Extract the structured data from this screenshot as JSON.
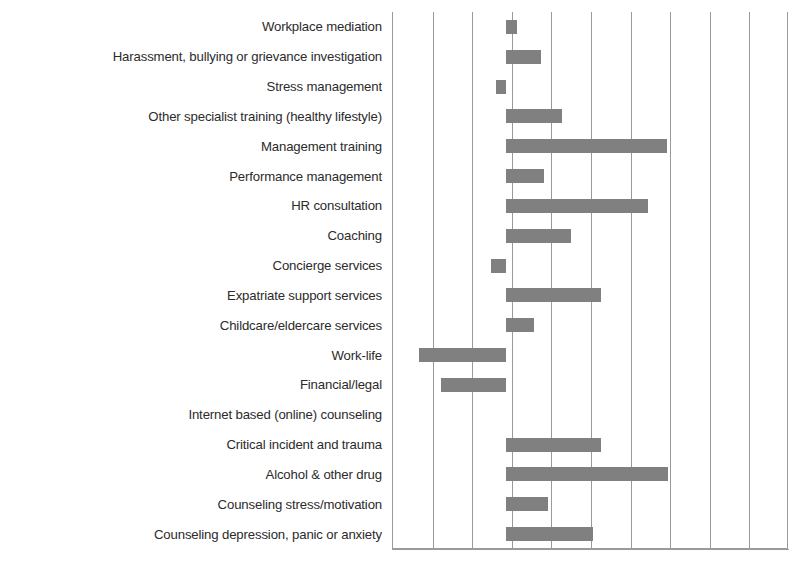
{
  "chart_data": {
    "type": "bar",
    "orientation": "horizontal",
    "title": "",
    "subtitle": "",
    "xlabel": "",
    "ylabel": "",
    "grid": true,
    "legend": false,
    "legend_position": "none",
    "bar_color": "#808080",
    "axis_color": "#9a9a9a",
    "gridline_color": "#9a9a9a",
    "label_color": "#2b2b2b",
    "xlim": [
      -2.85,
      7.15
    ],
    "x_tick_count": 11,
    "x_tick_labels": [],
    "zero_baseline": 0,
    "categories": [
      "Workplace mediation",
      "Harassment, bullying or grievance investigation",
      "Stress management",
      "Other specialist training (healthy lifestyle)",
      "Management training",
      "Performance management",
      "HR consultation",
      "Coaching",
      "Concierge services",
      "Expatriate support services",
      "Childcare/eldercare services",
      "Work-life",
      "Financial/legal",
      "Internet based (online) counseling",
      "Critical incident and trauma",
      "Alcohol & other drug",
      "Counseling stress/motivation",
      "Counseling depression, panic or anxiety"
    ],
    "values": [
      0.28,
      0.88,
      -0.25,
      1.41,
      4.07,
      0.96,
      3.6,
      1.64,
      -0.38,
      2.4,
      0.7,
      -2.2,
      -1.65,
      0,
      2.4,
      4.1,
      1.06,
      2.2
    ]
  }
}
